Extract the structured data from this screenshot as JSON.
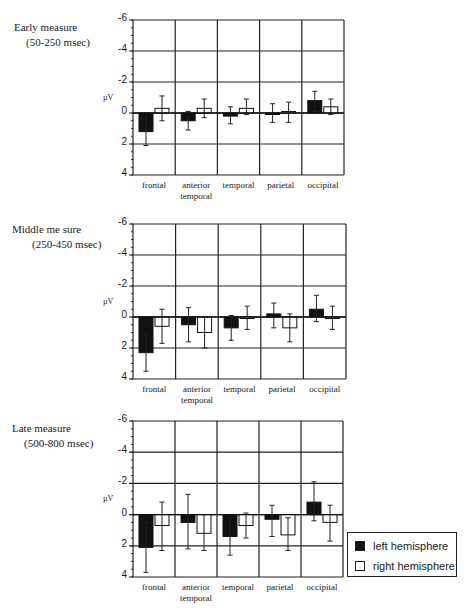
{
  "chart_data": [
    {
      "type": "bar",
      "title": "Early measure",
      "subtitle": "(50-250 msec)",
      "xlabel": "",
      "ylabel": "µV",
      "ylim": [
        -6,
        4
      ],
      "y_inverted": true,
      "yticks": [
        -6,
        -4,
        -2,
        0,
        2,
        4
      ],
      "grid": true,
      "categories": [
        "frontal",
        "anterior temporal",
        "temporal",
        "parietal",
        "occipital"
      ],
      "series": [
        {
          "name": "left hemisphere",
          "color": "#111111",
          "values": [
            1.2,
            0.5,
            0.2,
            0.0,
            -0.8
          ],
          "err_low": [
            0.0,
            -0.1,
            -0.4,
            -0.6,
            -1.4
          ],
          "err_high": [
            2.1,
            1.1,
            0.7,
            0.6,
            -0.1
          ]
        },
        {
          "name": "right hemisphere",
          "color": "#ffffff",
          "values": [
            -0.3,
            -0.3,
            -0.3,
            -0.1,
            -0.4
          ],
          "err_low": [
            -1.1,
            -0.9,
            -0.9,
            -0.7,
            -0.9
          ],
          "err_high": [
            0.5,
            0.3,
            0.1,
            0.6,
            0.1
          ]
        }
      ]
    },
    {
      "type": "bar",
      "title": "Middle measure",
      "subtitle": "(250-450 msec)",
      "xlabel": "",
      "ylabel": "µV",
      "ylim": [
        -6,
        4
      ],
      "y_inverted": true,
      "yticks": [
        -6,
        -4,
        -2,
        0,
        2,
        4
      ],
      "grid": true,
      "categories": [
        "frontal",
        "anterior temporal",
        "temporal",
        "parietal",
        "occipital"
      ],
      "series": [
        {
          "name": "left hemisphere",
          "color": "#111111",
          "values": [
            2.3,
            0.5,
            0.7,
            -0.2,
            -0.5
          ],
          "err_low": [
            1.1,
            -0.6,
            -0.1,
            -0.9,
            -1.4
          ],
          "err_high": [
            3.5,
            1.6,
            1.5,
            0.7,
            0.3
          ]
        },
        {
          "name": "right hemisphere",
          "color": "#ffffff",
          "values": [
            0.6,
            1.0,
            0.0,
            0.7,
            0.0
          ],
          "err_low": [
            -0.5,
            0.0,
            -0.7,
            -0.2,
            -0.7
          ],
          "err_high": [
            1.7,
            2.0,
            0.8,
            1.6,
            0.8
          ]
        }
      ]
    },
    {
      "type": "bar",
      "title": "Late measure",
      "subtitle": "(500-800 msec)",
      "xlabel": "",
      "ylabel": "µV",
      "ylim": [
        -6,
        4
      ],
      "y_inverted": true,
      "yticks": [
        -6,
        -4,
        -2,
        0,
        2,
        4
      ],
      "grid": true,
      "categories": [
        "frontal",
        "anterior temporal",
        "temporal",
        "parietal",
        "occipital"
      ],
      "legend": {
        "position": "bottom-right",
        "entries": [
          "left hemisphere",
          "right hemisphere"
        ]
      },
      "series": [
        {
          "name": "left hemisphere",
          "color": "#111111",
          "values": [
            2.1,
            0.5,
            1.4,
            0.3,
            -0.8
          ],
          "err_low": [
            0.5,
            -1.3,
            0.2,
            -0.6,
            -2.1
          ],
          "err_high": [
            3.7,
            2.2,
            2.6,
            1.4,
            0.4
          ]
        },
        {
          "name": "right hemisphere",
          "color": "#ffffff",
          "values": [
            0.7,
            1.2,
            0.7,
            1.3,
            0.5
          ],
          "err_low": [
            -0.8,
            0.0,
            -0.1,
            0.2,
            -0.6
          ],
          "err_high": [
            2.3,
            2.3,
            1.5,
            2.3,
            1.7
          ]
        }
      ]
    }
  ],
  "panels": [
    {
      "title": "Early measure",
      "subtitle": "(50-250 msec)"
    },
    {
      "title": "Middle me sure",
      "subtitle": "(250-450 msec)"
    },
    {
      "title": "Late measure",
      "subtitle": "(500-800 msec)"
    }
  ],
  "axis": {
    "ylabel": "µV",
    "ticks": [
      "-6",
      "-4",
      "-2",
      "0",
      "2",
      "4"
    ]
  },
  "categories": [
    {
      "line1": "frontal",
      "line2": ""
    },
    {
      "line1": "anterior",
      "line2": "temporal"
    },
    {
      "line1": "temporal",
      "line2": ""
    },
    {
      "line1": "parietal",
      "line2": ""
    },
    {
      "line1": "occipital",
      "line2": ""
    }
  ],
  "legend": {
    "left": "left hemisphere",
    "right": "right hemisphere"
  }
}
